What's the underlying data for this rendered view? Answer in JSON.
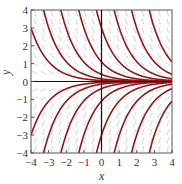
{
  "chart_data": {
    "type": "line",
    "title": "",
    "xlabel": "x",
    "ylabel": "y",
    "xlim": [
      -4,
      4
    ],
    "ylim": [
      -4,
      4
    ],
    "xticks": [
      "−4",
      "−3",
      "−2",
      "−1",
      "0",
      "1",
      "2",
      "3",
      "4"
    ],
    "yticks": [
      "4",
      "3",
      "2",
      "1",
      "0",
      "−1",
      "−2",
      "−3",
      "−4"
    ],
    "grid": false,
    "curve_color": "#8b1a1a",
    "field_color": "#999999",
    "series": [
      {
        "name": "C=3e-4 .. ",
        "C_values": [
          0.055,
          0.15,
          0.4,
          1.1,
          3,
          8.2,
          22,
          60,
          -0.055,
          -0.15,
          -0.4,
          -1.1,
          -3,
          -8.2,
          -22,
          -60
        ]
      }
    ]
  }
}
